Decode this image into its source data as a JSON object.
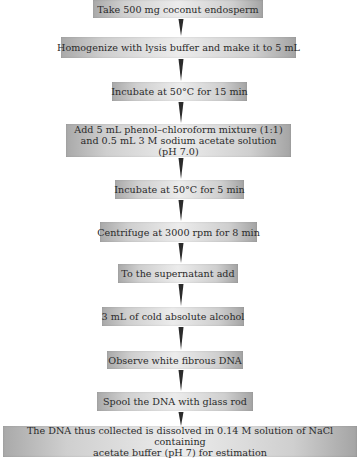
{
  "flowchart": {
    "steps": [
      {
        "label": "Take 500 mg coconut endosperm"
      },
      {
        "label": "Homogenize with lysis buffer and make it to 5 mL"
      },
      {
        "label": "Incubate at 50°C for 15 min"
      },
      {
        "label": "Add 5 mL phenol–chloroform mixture (1:1)",
        "label2": "and 0.5 mL 3 M sodium acetate solution (pH 7.0)"
      },
      {
        "label": "Incubate at 50°C for 5 min"
      },
      {
        "label": "Centrifuge at 3000 rpm for 8 min"
      },
      {
        "label": "To the supernatant add"
      },
      {
        "label": "3 mL of cold absolute alcohol"
      },
      {
        "label": "Observe white fibrous DNA"
      },
      {
        "label": "Spool the DNA with glass rod"
      },
      {
        "label": "The DNA thus collected is dissolved in 0.14 M solution of NaCl containing",
        "label2": "acetate buffer (pH 7) for estimation"
      }
    ],
    "colors": {
      "box_edge": "#a9a9a9",
      "box_center": "#ececec",
      "text": "#2a2a2a",
      "arrow": "#2b2b2b"
    }
  }
}
